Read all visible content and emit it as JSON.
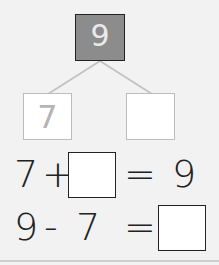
{
  "number_bond": {
    "whole": "9",
    "part_left": "7",
    "part_right": ""
  },
  "equations": [
    {
      "a": "7",
      "op": "+",
      "b": "",
      "eq": "=",
      "result": "9"
    },
    {
      "a": "9",
      "op": "-",
      "b": "7",
      "eq": "=",
      "result": ""
    }
  ],
  "colors": {
    "whole_fill": "#8c8c8c",
    "line": "#bdbdbd",
    "background": "#f2f2f2"
  }
}
